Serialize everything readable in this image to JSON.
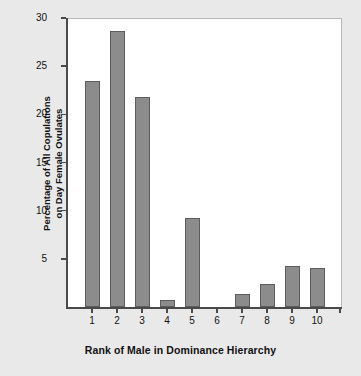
{
  "chart_data": {
    "type": "bar",
    "title": "",
    "xlabel": "Rank of Male in Dominance Hierarchy",
    "ylabel": "Percentage of All Copulations\non Day Female Ovulates",
    "ylabel_line1": "Percentage of All Copulations",
    "ylabel_line2": "on Day Female Ovulates",
    "categories": [
      "1",
      "2",
      "3",
      "4",
      "5",
      "6",
      "7",
      "8",
      "9",
      "10"
    ],
    "values": [
      23.5,
      28.6,
      21.8,
      0.7,
      9.2,
      0,
      1.4,
      2.4,
      4.3,
      4.1
    ],
    "ylim": [
      0,
      30
    ],
    "yticks": [
      5,
      10,
      15,
      20,
      25,
      30
    ],
    "ytick_labels": [
      "5",
      "10",
      "15",
      "20",
      "25",
      "30"
    ],
    "xtick_labels": [
      "1",
      "2",
      "3",
      "4",
      "5",
      "6",
      "7",
      "8",
      "9",
      "10"
    ],
    "extra_xtick": true,
    "grid": false,
    "legend": null,
    "bar_color": "#8c8c8c",
    "bar_edge_color": "#5d5d5d",
    "plot_background": "#ffffff",
    "figure_background": "#e9e9e9",
    "axis_color": "#4a4a4a",
    "text_color": "#111111"
  }
}
